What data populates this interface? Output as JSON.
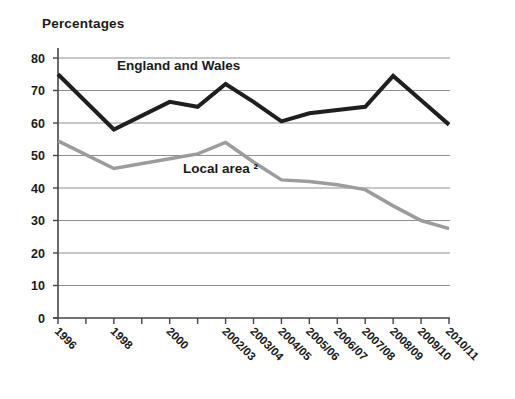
{
  "page": {
    "background": "#ffffff"
  },
  "chart_data": {
    "type": "line",
    "title": "Percentages",
    "grid": "horizontal",
    "legend_position": "inline-annotations",
    "colors": {
      "series_dark": "#1f1f1f",
      "series_gray": "#9c9c9c",
      "gridline": "#8f8f8f",
      "axis": "#454545",
      "text": "#1a1a1a"
    },
    "y_axis": {
      "min": 0,
      "max": 80,
      "step": 10,
      "tick_labels": [
        "0",
        "10",
        "20",
        "30",
        "40",
        "50",
        "60",
        "70",
        "80"
      ]
    },
    "x_axis": {
      "slot_count": 15,
      "tick_labels": [
        {
          "slot": 0,
          "label": "1996"
        },
        {
          "slot": 2,
          "label": "1998"
        },
        {
          "slot": 4,
          "label": "2000"
        },
        {
          "slot": 6,
          "label": "2002/03"
        },
        {
          "slot": 7,
          "label": "2003/04"
        },
        {
          "slot": 8,
          "label": "2004/05"
        },
        {
          "slot": 9,
          "label": "2005/06"
        },
        {
          "slot": 10,
          "label": "2006/07"
        },
        {
          "slot": 11,
          "label": "2007/08"
        },
        {
          "slot": 12,
          "label": "2008/09"
        },
        {
          "slot": 13,
          "label": "2009/10"
        },
        {
          "slot": 14,
          "label": "2010/11"
        }
      ]
    },
    "series": [
      {
        "name": "England and Wales",
        "color": "#1f1f1f",
        "stroke_width": 4,
        "points": [
          {
            "slot": 0,
            "value": 75
          },
          {
            "slot": 2,
            "value": 58
          },
          {
            "slot": 4,
            "value": 66.5
          },
          {
            "slot": 5,
            "value": 65
          },
          {
            "slot": 6,
            "value": 72
          },
          {
            "slot": 7,
            "value": 66.5
          },
          {
            "slot": 8,
            "value": 60.5
          },
          {
            "slot": 9,
            "value": 63
          },
          {
            "slot": 10,
            "value": 64
          },
          {
            "slot": 11,
            "value": 65
          },
          {
            "slot": 12,
            "value": 74.5
          },
          {
            "slot": 13,
            "value": 67
          },
          {
            "slot": 14,
            "value": 59.5
          }
        ]
      },
      {
        "name": "Local area ²",
        "color": "#9c9c9c",
        "stroke_width": 3.5,
        "points": [
          {
            "slot": 0,
            "value": 54.5
          },
          {
            "slot": 2,
            "value": 46
          },
          {
            "slot": 4,
            "value": 49
          },
          {
            "slot": 5,
            "value": 50.5
          },
          {
            "slot": 6,
            "value": 54
          },
          {
            "slot": 7,
            "value": 48
          },
          {
            "slot": 8,
            "value": 42.5
          },
          {
            "slot": 9,
            "value": 42
          },
          {
            "slot": 10,
            "value": 41
          },
          {
            "slot": 11,
            "value": 39.5
          },
          {
            "slot": 12,
            "value": 34.5
          },
          {
            "slot": 13,
            "value": 30
          },
          {
            "slot": 14,
            "value": 27.5
          }
        ]
      }
    ],
    "annotations": [
      {
        "text": "England and Wales"
      },
      {
        "text": "Local area ²"
      }
    ]
  }
}
